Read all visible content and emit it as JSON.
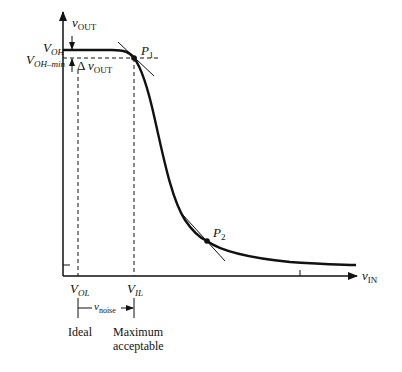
{
  "figure": {
    "type": "voltage-transfer-characteristic",
    "labels": {
      "y_axis": {
        "main": "v",
        "sub": "OUT"
      },
      "x_axis": {
        "main": "v",
        "sub": "IN"
      },
      "voh": {
        "main": "V",
        "sub": "OH"
      },
      "voh_min": {
        "main": "V",
        "sub": "OH–min"
      },
      "delta_vout": {
        "prefix": "Δ ",
        "main": "v",
        "sub": "OUT"
      },
      "p1": {
        "main": "P",
        "sub": "1"
      },
      "p2": {
        "main": "P",
        "sub": "2"
      },
      "vol": {
        "main": "V",
        "sub": "OL"
      },
      "vil": {
        "main": "V",
        "sub": "IL"
      },
      "vnoise": {
        "main": "v",
        "sub": "noise"
      },
      "ideal": "Ideal",
      "max_line1": "Maximum",
      "max_line2": "acceptable"
    },
    "colors": {
      "ink": "#111111",
      "background": "#ffffff"
    }
  }
}
